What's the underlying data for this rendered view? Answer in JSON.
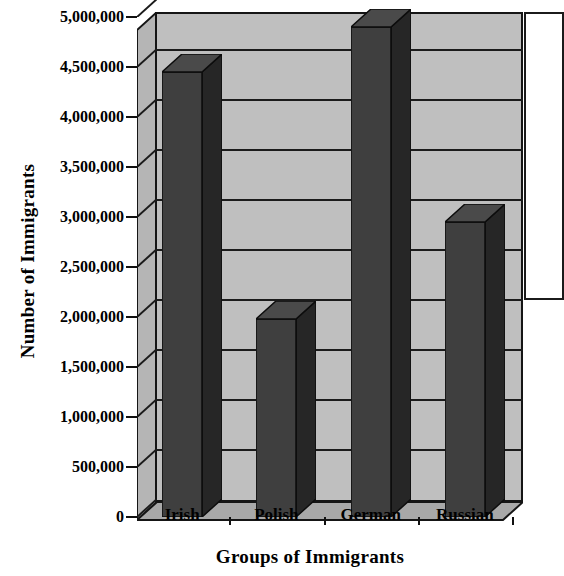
{
  "chart_data": {
    "type": "bar",
    "title": "",
    "subtitle": "",
    "xlabel": "Groups of Immigrants",
    "ylabel": "Number of Immigrants",
    "categories": [
      "Irish",
      "Polish",
      "German",
      "Russian"
    ],
    "values": [
      4450000,
      1980000,
      4900000,
      2950000
    ],
    "series": [
      {
        "name": "Number of Immigrants",
        "values": [
          4450000,
          1980000,
          4900000,
          2950000
        ]
      }
    ],
    "ylim": [
      0,
      5000000
    ],
    "ytick_values": [
      0,
      500000,
      1000000,
      1500000,
      2000000,
      2500000,
      3000000,
      3500000,
      4000000,
      4500000,
      5000000
    ],
    "ytick_labels": [
      "0",
      "500,000",
      "1,000,000",
      "1,500,000",
      "2,000,000",
      "2,500,000",
      "3,000,000",
      "3,500,000",
      "4,000,000",
      "4,500,000",
      "5,000,000"
    ],
    "grid": true,
    "grid_axis": "y",
    "legend": false,
    "legend_position": "right",
    "style": "3d-column",
    "colors": {
      "bar_front": "#3f3f3f",
      "bar_side": "#262626",
      "bar_top": "#4a4a4a",
      "plot_background": "#bfbfbf",
      "floor": "#a8a8a8",
      "side_wall": "#b5b5b5",
      "gridline": "#1b1b1b",
      "axis": "#111111",
      "text": "#000000",
      "page_background": "#ffffff"
    }
  }
}
